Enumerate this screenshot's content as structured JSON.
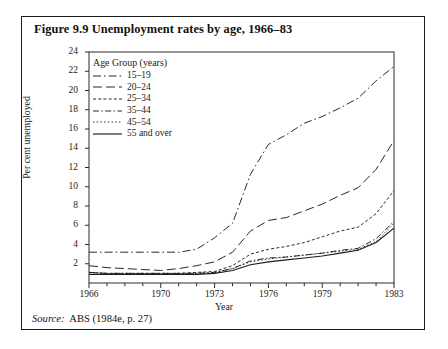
{
  "figure": {
    "title": "Figure 9.9  Unemployment rates by age, 1966–83",
    "source_key": "Source:",
    "source_value": "ABS (1984e, p. 27)"
  },
  "chart_data": {
    "type": "line",
    "title": "Unemployment rates by age, 1966–83",
    "xlabel": "Year",
    "ylabel": "Per cent unemployed",
    "x": [
      1966,
      1967,
      1968,
      1969,
      1970,
      1971,
      1972,
      1973,
      1974,
      1975,
      1976,
      1977,
      1978,
      1979,
      1980,
      1981,
      1982,
      1983
    ],
    "xticks": [
      1966,
      1970,
      1973,
      1976,
      1979,
      1983
    ],
    "xtick_labels": [
      "1966",
      "1970",
      "1973",
      "1976",
      "1979",
      "1983"
    ],
    "yticks": [
      2,
      4,
      6,
      8,
      10,
      12,
      14,
      16,
      18,
      20,
      22,
      24
    ],
    "ytick_labels": [
      "2",
      "4",
      "6",
      "8",
      "10",
      "12",
      "14",
      "16",
      "18",
      "20",
      "22",
      "24"
    ],
    "xlim": [
      1966,
      1983
    ],
    "ylim": [
      0,
      24
    ],
    "grid": false,
    "legend_position": "upper-left-inside",
    "legend_title": "Age Group (years)",
    "series": [
      {
        "name": "15–19",
        "dash": "long-dash-dot",
        "values": [
          3.2,
          3.2,
          3.2,
          3.2,
          3.2,
          3.2,
          3.5,
          4.7,
          6.2,
          11.3,
          14.4,
          15.4,
          16.6,
          17.3,
          18.2,
          19.2,
          21.0,
          22.5
        ]
      },
      {
        "name": "20–24",
        "dash": "long-dash",
        "values": [
          1.8,
          1.6,
          1.5,
          1.4,
          1.3,
          1.5,
          1.8,
          2.2,
          3.2,
          5.4,
          6.5,
          6.8,
          7.5,
          8.2,
          9.1,
          9.9,
          11.8,
          14.8
        ]
      },
      {
        "name": "25–34",
        "dash": "fine-dash",
        "values": [
          1.1,
          1.0,
          1.0,
          1.0,
          1.0,
          1.0,
          1.1,
          1.2,
          1.8,
          3.0,
          3.5,
          3.8,
          4.2,
          4.8,
          5.4,
          5.8,
          7.2,
          9.6
        ]
      },
      {
        "name": "35–44",
        "dash": "dash-dot",
        "values": [
          1.1,
          1.0,
          1.0,
          1.0,
          1.0,
          1.0,
          1.0,
          1.1,
          1.5,
          2.3,
          2.6,
          2.7,
          2.9,
          3.1,
          3.4,
          3.6,
          4.6,
          6.4
        ]
      },
      {
        "name": "45–54",
        "dash": "dotted",
        "values": [
          1.1,
          1.0,
          1.0,
          1.0,
          1.0,
          1.0,
          1.0,
          1.1,
          1.5,
          2.2,
          2.5,
          2.7,
          2.9,
          3.1,
          3.3,
          3.5,
          4.3,
          6.2
        ]
      },
      {
        "name": "55 and over",
        "dash": "solid",
        "values": [
          0.9,
          0.9,
          0.9,
          0.9,
          0.9,
          0.9,
          0.9,
          1.0,
          1.3,
          1.9,
          2.2,
          2.4,
          2.6,
          2.8,
          3.1,
          3.4,
          4.2,
          5.7
        ]
      }
    ]
  }
}
